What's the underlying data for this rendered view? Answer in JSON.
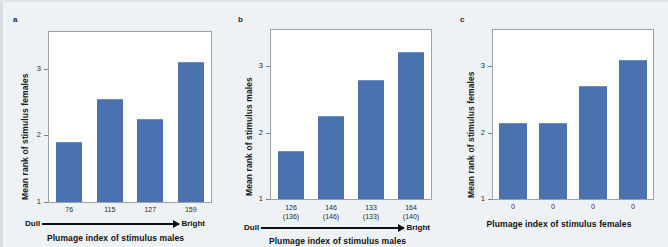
{
  "figure": {
    "background_color": "#eef2f5",
    "bar_color": "#4a72b0",
    "plot_background": "#ffffff"
  },
  "panels": [
    {
      "letter": "a",
      "ylabel": "Mean rank of stimulus females",
      "xtitle": "Plumage index of stimulus males",
      "arrow_left": "Dull",
      "arrow_right": "Bright"
    },
    {
      "letter": "b",
      "ylabel": "Mean rank of stimulus males",
      "xtitle": "Plumage index of stimulus males",
      "arrow_left": "Dull",
      "arrow_right": "Bright"
    },
    {
      "letter": "c",
      "ylabel": "Mean rank of stimulus females",
      "xtitle": "Plumage index of stimulus females"
    }
  ],
  "chart_data": [
    {
      "type": "bar",
      "panel": "a",
      "title": "",
      "xlabel": "Plumage index of stimulus males",
      "ylabel": "Mean rank of stimulus females",
      "categories": [
        "76",
        "115",
        "127",
        "159"
      ],
      "values": [
        1.9,
        2.55,
        2.25,
        3.1
      ],
      "ylim": [
        1,
        3.55
      ],
      "yticks": [
        "1",
        "2",
        "3"
      ],
      "ytick_values": [
        1,
        2,
        3
      ],
      "grid": false,
      "legend": "none",
      "annotation_left": "Dull",
      "annotation_right": "Bright"
    },
    {
      "type": "bar",
      "panel": "b",
      "title": "",
      "xlabel": "Plumage index of stimulus males",
      "ylabel": "Mean rank of stimulus males",
      "categories": [
        "126\n(136)",
        "146\n(146)",
        "133\n(133)",
        "164\n(140)"
      ],
      "values": [
        1.72,
        2.25,
        2.8,
        3.22
      ],
      "ylim": [
        1,
        3.55
      ],
      "yticks": [
        "1",
        "2",
        "3"
      ],
      "ytick_values": [
        1,
        2,
        3
      ],
      "grid": false,
      "legend": "none",
      "annotation_left": "Dull",
      "annotation_right": "Bright"
    },
    {
      "type": "bar",
      "panel": "c",
      "title": "",
      "xlabel": "Plumage index of stimulus females",
      "ylabel": "Mean rank of stimulus females",
      "categories": [
        "0",
        "0",
        "0",
        "0"
      ],
      "values": [
        2.15,
        2.15,
        2.7,
        3.1
      ],
      "ylim": [
        1,
        3.55
      ],
      "yticks": [
        "1",
        "2",
        "3"
      ],
      "ytick_values": [
        1,
        2,
        3
      ],
      "grid": false,
      "legend": "none"
    }
  ]
}
